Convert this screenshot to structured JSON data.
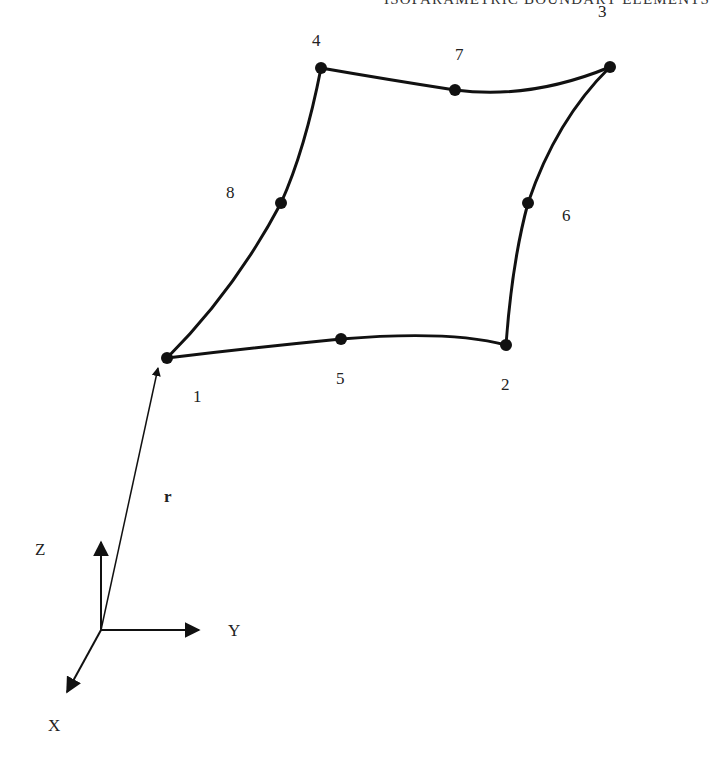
{
  "header": {
    "running_title": "ISOPARAMETRIC BOUNDARY ELEMENTS"
  },
  "figure": {
    "nodes": [
      {
        "id": "1",
        "label": "1",
        "x": 167,
        "y": 358,
        "label_x": 193,
        "label_y": 388
      },
      {
        "id": "2",
        "label": "2",
        "x": 506,
        "y": 345,
        "label_x": 501,
        "label_y": 376
      },
      {
        "id": "3",
        "label": "3",
        "x": 610,
        "y": 67,
        "label_x": 598,
        "label_y": 3
      },
      {
        "id": "4",
        "label": "4",
        "x": 321,
        "y": 68,
        "label_x": 312,
        "label_y": 32
      },
      {
        "id": "5",
        "label": "5",
        "x": 341,
        "y": 339,
        "label_x": 336,
        "label_y": 370
      },
      {
        "id": "6",
        "label": "6",
        "x": 528,
        "y": 203,
        "label_x": 562,
        "label_y": 207
      },
      {
        "id": "7",
        "label": "7",
        "x": 455,
        "y": 90,
        "label_x": 455,
        "label_y": 46
      },
      {
        "id": "8",
        "label": "8",
        "x": 281,
        "y": 203,
        "label_x": 226,
        "label_y": 184
      }
    ],
    "edges": [
      {
        "from": "1",
        "mid": "5",
        "to": "2"
      },
      {
        "from": "2",
        "mid": "6",
        "to": "3"
      },
      {
        "from": "3",
        "mid": "7",
        "to": "4"
      },
      {
        "from": "4",
        "mid": "8",
        "to": "1"
      }
    ],
    "position_vector": {
      "label": "r",
      "from": "origin",
      "to": "1"
    },
    "axes": {
      "origin": {
        "x": 101,
        "y": 630
      },
      "labels": {
        "x": "X",
        "y": "Y",
        "z": "Z"
      }
    }
  }
}
